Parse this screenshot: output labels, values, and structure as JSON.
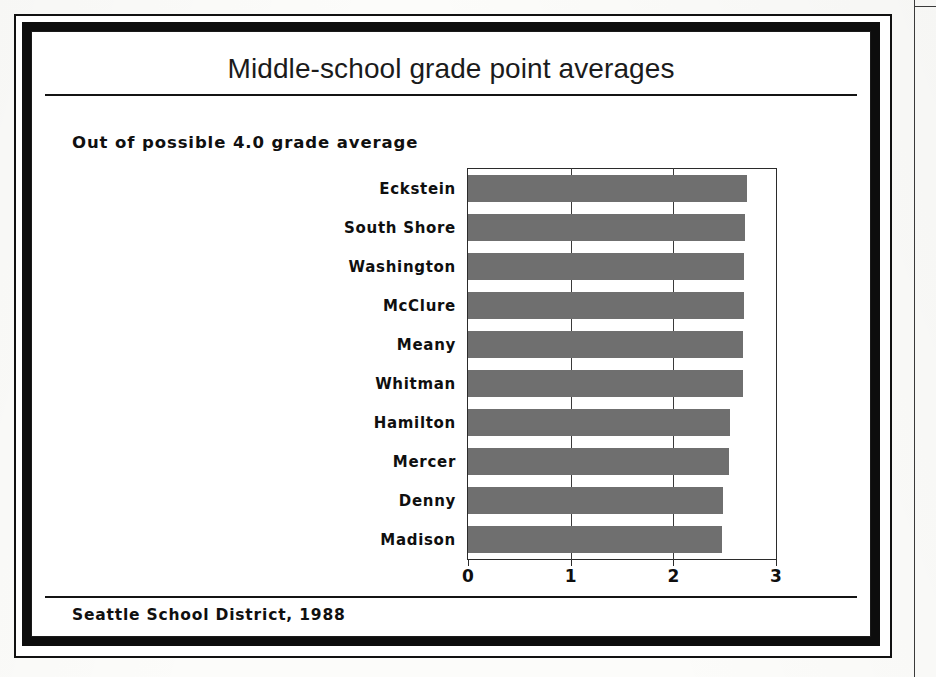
{
  "figure": {
    "title": "Middle-school grade point averages",
    "subtitle": "Out of possible 4.0 grade average",
    "source": "Seattle School District, 1988",
    "bar_color": "#6f6f6f",
    "frame_color": "#0d0d0d",
    "text_color": "#101010"
  },
  "chart_data": {
    "type": "bar",
    "orientation": "horizontal",
    "title": "Middle-school grade point averages",
    "subtitle": "Out of possible 4.0 grade average",
    "xlabel": "",
    "ylabel": "",
    "xlim": [
      0,
      3
    ],
    "xticks": [
      0,
      1,
      2,
      3
    ],
    "xtick_labels": [
      "0",
      "1",
      "2",
      "3"
    ],
    "grid": true,
    "legend": false,
    "source": "Seattle School District, 1988",
    "categories": [
      "Eckstein",
      "South Shore",
      "Washington",
      "McClure",
      "Meany",
      "Whitman",
      "Hamilton",
      "Mercer",
      "Denny",
      "Madison"
    ],
    "values": [
      2.72,
      2.7,
      2.69,
      2.69,
      2.68,
      2.68,
      2.55,
      2.54,
      2.48,
      2.47
    ]
  },
  "ticks": [
    {
      "label": "0",
      "value": 0
    },
    {
      "label": "1",
      "value": 1
    },
    {
      "label": "2",
      "value": 2
    },
    {
      "label": "3",
      "value": 3
    }
  ]
}
